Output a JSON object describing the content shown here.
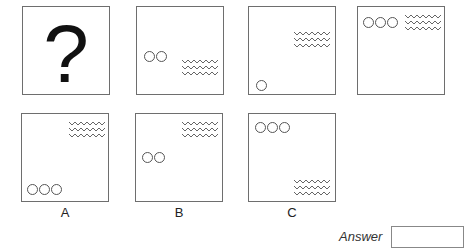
{
  "question": {
    "placeholder_symbol": "?",
    "sequence": [
      {
        "id": "seq-1",
        "content": "question-mark"
      },
      {
        "id": "seq-2",
        "circles": 2,
        "circles_position": "middle-left",
        "zigzag_position": "middle-right"
      },
      {
        "id": "seq-3",
        "circles": 1,
        "circles_position": "bottom-left",
        "zigzag_position": "top-right"
      },
      {
        "id": "seq-4",
        "circles": 3,
        "circles_position": "top-left",
        "zigzag_position": "top-right"
      }
    ]
  },
  "options": [
    {
      "label": "A",
      "circles": 3,
      "circles_position": "bottom-left",
      "zigzag_position": "top-right"
    },
    {
      "label": "B",
      "circles": 2,
      "circles_position": "middle-left",
      "zigzag_position": "top-right"
    },
    {
      "label": "C",
      "circles": 3,
      "circles_position": "top-left",
      "zigzag_position": "bottom-right"
    }
  ],
  "answer": {
    "label": "Answer",
    "value": ""
  },
  "colors": {
    "border": "#6e6e6e",
    "shape_stroke": "#555555",
    "text": "#222222"
  }
}
